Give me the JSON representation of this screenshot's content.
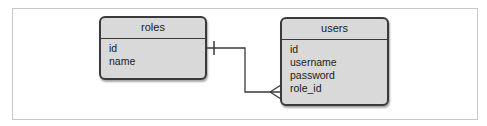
{
  "diagram": {
    "type": "entity-relationship",
    "entities": [
      {
        "name": "roles",
        "fields": [
          "id",
          "name"
        ]
      },
      {
        "name": "users",
        "fields": [
          "id",
          "username",
          "password",
          "role_id"
        ]
      }
    ],
    "relationships": [
      {
        "from": "roles",
        "from_cardinality": "one",
        "to": "users",
        "to_cardinality": "many",
        "to_field": "role_id"
      }
    ]
  },
  "colors": {
    "entity_fill": "#d9d9d9",
    "entity_border": "#3a3a3a",
    "line": "#3a3a3a",
    "frame": "#c8c8c8"
  }
}
